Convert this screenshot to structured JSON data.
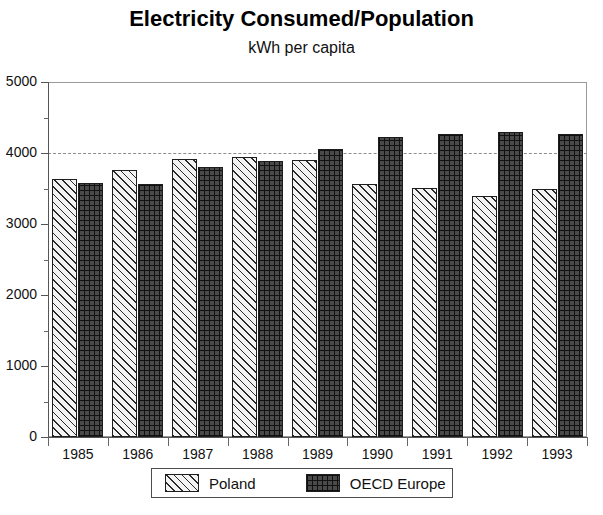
{
  "chart_data": {
    "type": "bar",
    "title": "Electricity Consumed/Population",
    "subtitle": "kWh per capita",
    "xlabel": "",
    "ylabel": "",
    "ylim": [
      0,
      5000
    ],
    "y_ticks": [
      0,
      1000,
      2000,
      3000,
      4000,
      5000
    ],
    "y_minor_ticks": [
      500,
      1500,
      2500,
      3500,
      4500
    ],
    "grid": "dashed horizontal line at 4000 only",
    "legend_position": "bottom-center",
    "categories": [
      "1985",
      "1986",
      "1987",
      "1988",
      "1989",
      "1990",
      "1991",
      "1992",
      "1993"
    ],
    "series": [
      {
        "name": "Poland",
        "pattern": "diagonal-hatch-light",
        "color": "#f3f3f3",
        "values": [
          3640,
          3760,
          3920,
          3940,
          3900,
          3570,
          3510,
          3400,
          3490
        ]
      },
      {
        "name": "OECD Europe",
        "pattern": "brick-dark",
        "color": "#4a4a4a",
        "values": [
          3580,
          3570,
          3810,
          3890,
          4050,
          4230,
          4270,
          4290,
          4270
        ]
      }
    ]
  },
  "legend": {
    "items": [
      {
        "label": "Poland"
      },
      {
        "label": "OECD Europe"
      }
    ]
  }
}
